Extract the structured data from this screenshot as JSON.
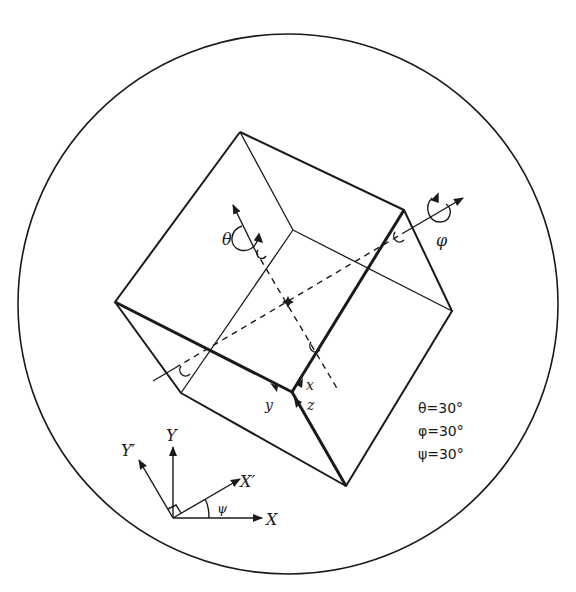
{
  "diagram": {
    "type": "rotated-cube-euler-angles",
    "labels": {
      "theta_axis": "θ",
      "phi_axis": "φ",
      "x_local": "x",
      "y_local": "y",
      "z_local": "z",
      "X": "X",
      "Y": "Y",
      "X_prime": "X′",
      "Y_prime": "Y′",
      "psi": "ψ"
    },
    "angles": [
      {
        "name": "theta",
        "text": "θ=30°"
      },
      {
        "name": "phi",
        "text": "φ=30°"
      },
      {
        "name": "psi",
        "text": "ψ=30°"
      }
    ],
    "colors": {
      "ink": "#1a1a1a",
      "background": "#ffffff"
    }
  }
}
